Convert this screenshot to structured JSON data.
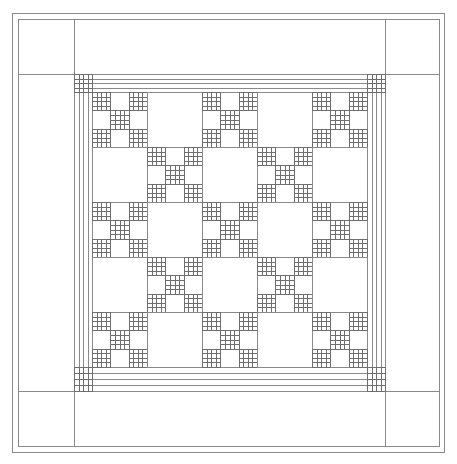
{
  "diagram": {
    "type": "quilt-pattern",
    "stroke_color": "#8a8a8a",
    "grid_stroke_color": "#6e6e6e",
    "background": "#ffffff",
    "binding": {
      "outer": {
        "x1": 12,
        "y1": 13,
        "x2": 444,
        "y2": 452
      },
      "inner": {
        "x1": 18,
        "y1": 19,
        "x2": 439,
        "y2": 446
      }
    },
    "outer_border": {
      "separator_x_left": 74,
      "separator_x_right": 385,
      "separator_y_top": 74,
      "separator_y_bottom": 391
    },
    "strip_border": {
      "strips": 4,
      "x_left": 74,
      "x_right": 385,
      "y_top": 74,
      "y_bottom": 391,
      "cornerstone": "4x4-grid"
    },
    "center": {
      "x": 92,
      "y": 92,
      "width": 275,
      "height": 275,
      "rows": 5,
      "cols": 5,
      "block_pattern": "nine-patch where (row+col) even, plain otherwise",
      "nine_patch_filled_cells": [
        [
          0,
          0
        ],
        [
          0,
          2
        ],
        [
          1,
          1
        ],
        [
          2,
          0
        ],
        [
          2,
          2
        ]
      ],
      "filled_cell_grid": 4
    }
  }
}
